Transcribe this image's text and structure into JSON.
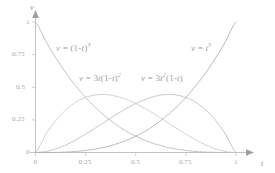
{
  "chart_data": {
    "type": "line",
    "title": "",
    "xlabel": "t",
    "ylabel": "v",
    "xlim": [
      0,
      1
    ],
    "ylim": [
      0,
      1
    ],
    "grid": false,
    "legend": "inline-annotations",
    "xticks": [
      "0",
      "0.25",
      "0.5",
      "0.75",
      "1"
    ],
    "xtick_values": [
      0,
      0.25,
      0.5,
      0.75,
      1
    ],
    "yticks": [
      "0",
      "0.25",
      "0.5",
      "0.75",
      "1"
    ],
    "ytick_values": [
      0,
      0.25,
      0.5,
      0.75,
      1
    ],
    "x": [
      0,
      0.05,
      0.1,
      0.15,
      0.2,
      0.25,
      0.3,
      0.35,
      0.4,
      0.45,
      0.5,
      0.55,
      0.6,
      0.65,
      0.7,
      0.75,
      0.8,
      0.85,
      0.9,
      0.95,
      1
    ],
    "series": [
      {
        "name": "v = (1-t)³",
        "color": "#b9b9b9",
        "values": [
          1,
          0.857,
          0.729,
          0.614,
          0.512,
          0.422,
          0.343,
          0.275,
          0.216,
          0.166,
          0.125,
          0.091,
          0.064,
          0.043,
          0.027,
          0.016,
          0.008,
          0.003,
          0.001,
          0.0,
          0
        ]
      },
      {
        "name": "v = 3t(1-t)²",
        "color": "#cccccc",
        "values": [
          0,
          0.135,
          0.243,
          0.325,
          0.384,
          0.422,
          0.441,
          0.444,
          0.432,
          0.408,
          0.375,
          0.334,
          0.288,
          0.239,
          0.189,
          0.141,
          0.096,
          0.057,
          0.027,
          0.007,
          0
        ]
      },
      {
        "name": "v = 3t²(1-t)",
        "color": "#bdbdbd",
        "values": [
          0,
          0.007,
          0.027,
          0.057,
          0.096,
          0.141,
          0.189,
          0.239,
          0.288,
          0.334,
          0.375,
          0.408,
          0.432,
          0.444,
          0.441,
          0.422,
          0.384,
          0.325,
          0.243,
          0.135,
          0
        ]
      },
      {
        "name": "v = t³",
        "color": "#b0b0b0",
        "values": [
          0,
          0.0,
          0.001,
          0.003,
          0.008,
          0.016,
          0.027,
          0.043,
          0.064,
          0.091,
          0.125,
          0.166,
          0.216,
          0.275,
          0.343,
          0.422,
          0.512,
          0.614,
          0.729,
          0.857,
          1
        ]
      }
    ],
    "annotations": [
      {
        "text": "v = (1-t)³",
        "base": "v = (1-",
        "sup_inner": "",
        "at_x": 0.21,
        "at_y": 0.8
      },
      {
        "text": "v = t³",
        "at_x": 0.82,
        "at_y": 0.8
      },
      {
        "text": "v = 3t(1-t)²",
        "at_x": 0.44,
        "at_y": 0.52
      },
      {
        "text": "v = 3t²(1-t)",
        "at_x": 0.72,
        "at_y": 0.52
      }
    ]
  },
  "axes": {
    "y_name": "v",
    "x_name": "t",
    "y_tick_1": "1",
    "y_tick_075": "0.75",
    "y_tick_05": "0.5",
    "y_tick_025": "0.25",
    "y_tick_0": "0",
    "x_tick_0": "0",
    "x_tick_025": "0.25",
    "x_tick_05": "0.5",
    "x_tick_075": "0.75",
    "x_tick_1": "1"
  },
  "labels": {
    "curve1_v": "v",
    "curve1_eq": " = (1-",
    "curve1_t": "t",
    "curve1_close": ")",
    "curve1_exp": "3",
    "curve4_v": "v",
    "curve4_eq": " = ",
    "curve4_t": "t",
    "curve4_exp": "3",
    "curve2_v": "v",
    "curve2_eq": " = 3",
    "curve2_t1": "t",
    "curve2_open": "(1-",
    "curve2_t2": "t",
    "curve2_close": ")",
    "curve2_exp": "2",
    "curve3_v": "v",
    "curve3_eq": " = 3",
    "curve3_t1": "t",
    "curve3_exp": "2",
    "curve3_open": "(1-",
    "curve3_t2": "t",
    "curve3_close": ")"
  },
  "colors": {
    "axis": "#bdbdbd",
    "text": "#a3a3a3",
    "curve_b0": "#b9b9b9",
    "curve_b1": "#cccccc",
    "curve_b2": "#bdbdbd",
    "curve_b3": "#b0b0b0"
  }
}
